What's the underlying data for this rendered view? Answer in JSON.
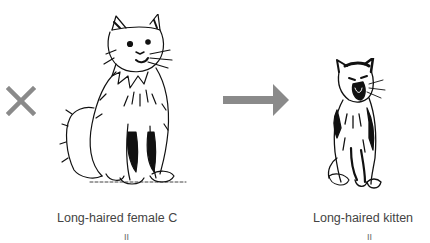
{
  "diagram": {
    "operator_symbol": "cross-icon",
    "result_symbol": "arrow-right-icon",
    "operator_color": "#8a8a8a",
    "arrow_color": "#8a8a8a",
    "parent": {
      "label": "Long-haired female C",
      "marker": "II",
      "illustration": "sitting-long-haired-cat"
    },
    "offspring": {
      "label": "Long-haired kitten",
      "marker": "II",
      "illustration": "yawning-long-haired-kitten"
    }
  }
}
